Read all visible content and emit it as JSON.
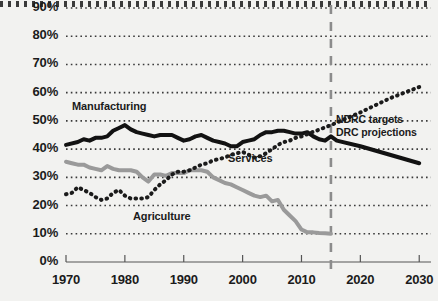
{
  "chart_data": {
    "type": "line",
    "title": "",
    "xlabel": "",
    "ylabel": "",
    "xlim": [
      1970,
      2032
    ],
    "ylim": [
      0,
      90
    ],
    "grid": true,
    "grid_style": "dotted-horizontal",
    "legend_position": "inline-annotations",
    "x_ticks": [
      "1970",
      "1980",
      "1990",
      "2000",
      "2010",
      "2020",
      "2030"
    ],
    "x_tick_values": [
      1970,
      1980,
      1990,
      2000,
      2010,
      2020,
      2030
    ],
    "y_ticks": [
      "0%",
      "10%",
      "20%",
      "30%",
      "40%",
      "50%",
      "60%",
      "70%",
      "80%",
      "90%"
    ],
    "y_tick_values": [
      0,
      10,
      20,
      30,
      40,
      50,
      60,
      70,
      80,
      90
    ],
    "annotations": [
      {
        "name": "forecast-divider",
        "label": "",
        "x": 2015,
        "style": "dashed-vertical"
      },
      {
        "name": "ndrc-targets-note",
        "label": "NDRC targets"
      },
      {
        "name": "drc-projections-note",
        "label": "DRC projections"
      }
    ],
    "series": [
      {
        "name": "Manufacturing",
        "label": "Manufacturing",
        "color": "#121212",
        "style": "solid",
        "width": 4,
        "points": [
          [
            1970,
            41.5
          ],
          [
            1972,
            42.5
          ],
          [
            1973,
            43.5
          ],
          [
            1974,
            43.0
          ],
          [
            1975,
            44.0
          ],
          [
            1976,
            44.0
          ],
          [
            1977,
            44.5
          ],
          [
            1978,
            46.5
          ],
          [
            1979,
            47.5
          ],
          [
            1980,
            48.5
          ],
          [
            1981,
            47.0
          ],
          [
            1982,
            46.0
          ],
          [
            1983,
            45.5
          ],
          [
            1984,
            45.0
          ],
          [
            1985,
            44.5
          ],
          [
            1986,
            45.0
          ],
          [
            1987,
            45.0
          ],
          [
            1988,
            45.0
          ],
          [
            1989,
            44.0
          ],
          [
            1990,
            43.0
          ],
          [
            1991,
            43.5
          ],
          [
            1992,
            44.5
          ],
          [
            1993,
            45.0
          ],
          [
            1994,
            44.0
          ],
          [
            1995,
            43.0
          ],
          [
            1996,
            42.5
          ],
          [
            1997,
            42.0
          ],
          [
            1998,
            41.0
          ],
          [
            1999,
            41.0
          ],
          [
            2000,
            42.5
          ],
          [
            2001,
            43.0
          ],
          [
            2002,
            43.5
          ],
          [
            2003,
            45.0
          ],
          [
            2004,
            46.0
          ],
          [
            2005,
            46.0
          ],
          [
            2006,
            46.5
          ],
          [
            2007,
            46.5
          ],
          [
            2008,
            46.0
          ],
          [
            2009,
            45.5
          ],
          [
            2010,
            45.5
          ],
          [
            2011,
            46.0
          ],
          [
            2012,
            44.5
          ],
          [
            2013,
            43.5
          ],
          [
            2014,
            43.0
          ],
          [
            2015,
            44.5
          ],
          [
            2016,
            43.0
          ],
          [
            2020,
            41.0
          ],
          [
            2025,
            38.0
          ],
          [
            2030,
            35.0
          ]
        ]
      },
      {
        "name": "Agriculture",
        "label": "Agriculture",
        "color": "#9a9a9a",
        "style": "solid",
        "width": 4,
        "points": [
          [
            1970,
            35.5
          ],
          [
            1971,
            35.0
          ],
          [
            1972,
            34.5
          ],
          [
            1973,
            34.5
          ],
          [
            1974,
            33.5
          ],
          [
            1975,
            33.0
          ],
          [
            1976,
            32.5
          ],
          [
            1977,
            34.0
          ],
          [
            1978,
            33.0
          ],
          [
            1979,
            32.5
          ],
          [
            1980,
            32.5
          ],
          [
            1981,
            32.5
          ],
          [
            1982,
            32.0
          ],
          [
            1983,
            30.0
          ],
          [
            1984,
            28.5
          ],
          [
            1985,
            31.0
          ],
          [
            1986,
            31.0
          ],
          [
            1987,
            30.5
          ],
          [
            1988,
            31.5
          ],
          [
            1989,
            31.5
          ],
          [
            1990,
            31.5
          ],
          [
            1991,
            32.5
          ],
          [
            1992,
            32.5
          ],
          [
            1993,
            32.5
          ],
          [
            1994,
            32.0
          ],
          [
            1995,
            30.0
          ],
          [
            1996,
            29.0
          ],
          [
            1997,
            28.0
          ],
          [
            1998,
            27.5
          ],
          [
            1999,
            26.5
          ],
          [
            2000,
            25.5
          ],
          [
            2001,
            24.5
          ],
          [
            2002,
            23.5
          ],
          [
            2003,
            23.0
          ],
          [
            2004,
            23.5
          ],
          [
            2005,
            21.5
          ],
          [
            2006,
            22.0
          ],
          [
            2007,
            18.5
          ],
          [
            2008,
            16.5
          ],
          [
            2009,
            14.5
          ],
          [
            2010,
            11.5
          ],
          [
            2011,
            10.5
          ],
          [
            2012,
            10.5
          ],
          [
            2013,
            10.3
          ],
          [
            2014,
            10.2
          ],
          [
            2015,
            10.0
          ]
        ]
      },
      {
        "name": "Services",
        "label": "Services",
        "color": "#1b1b1b",
        "style": "dotted",
        "width": 4,
        "points": [
          [
            1970,
            24.0
          ],
          [
            1971,
            24.5
          ],
          [
            1972,
            26.5
          ],
          [
            1973,
            25.5
          ],
          [
            1974,
            24.5
          ],
          [
            1975,
            23.0
          ],
          [
            1976,
            22.0
          ],
          [
            1977,
            22.5
          ],
          [
            1978,
            24.5
          ],
          [
            1979,
            25.5
          ],
          [
            1980,
            23.5
          ],
          [
            1981,
            22.5
          ],
          [
            1982,
            22.5
          ],
          [
            1983,
            22.5
          ],
          [
            1984,
            23.0
          ],
          [
            1985,
            25.5
          ],
          [
            1986,
            27.5
          ],
          [
            1987,
            29.0
          ],
          [
            1988,
            31.0
          ],
          [
            1989,
            32.0
          ],
          [
            1990,
            32.0
          ],
          [
            1991,
            32.5
          ],
          [
            1992,
            33.5
          ],
          [
            1993,
            34.5
          ],
          [
            1994,
            35.0
          ],
          [
            1995,
            36.0
          ],
          [
            1996,
            36.5
          ],
          [
            1997,
            37.0
          ],
          [
            1998,
            38.0
          ],
          [
            1999,
            38.5
          ],
          [
            2000,
            39.0
          ],
          [
            2001,
            38.0
          ],
          [
            2002,
            37.0
          ],
          [
            2003,
            37.5
          ],
          [
            2004,
            38.5
          ],
          [
            2005,
            40.0
          ],
          [
            2006,
            41.5
          ],
          [
            2007,
            42.5
          ],
          [
            2008,
            43.0
          ],
          [
            2009,
            44.0
          ],
          [
            2010,
            44.5
          ],
          [
            2015,
            48.5
          ],
          [
            2020,
            53.0
          ],
          [
            2025,
            58.0
          ],
          [
            2030,
            62.0
          ]
        ]
      }
    ]
  },
  "labels": {
    "manufacturing": "Manufacturing",
    "services": "Services",
    "agriculture": "Agriculture",
    "ndrc_targets": "NDRC targets",
    "drc_projections": "DRC projections"
  },
  "colors": {
    "background": "#f2f2f0",
    "manufacturing": "#121212",
    "agriculture": "#9a9a9a",
    "services": "#1b1b1b",
    "axis": "#555555",
    "grid": "#3a3a3a",
    "divider": "#8c8c8c",
    "text": "#1b1b1b"
  }
}
